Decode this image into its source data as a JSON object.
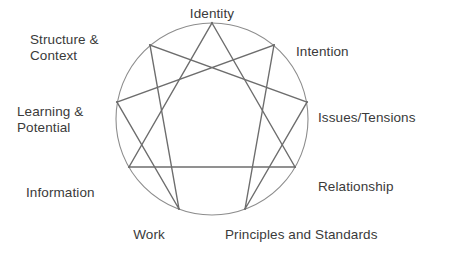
{
  "diagram": {
    "type": "enneagram",
    "stroke_color": "#6d6d6d",
    "circle_color": "#8d8d8d",
    "text_color": "#3a3a3a",
    "background_color": "#ffffff",
    "circle": {
      "cx": 212,
      "cy": 119,
      "r": 96
    },
    "nodes": [
      {
        "id": "identity",
        "label": "Identity",
        "point": 9,
        "angle_deg": -90,
        "x": 212,
        "y": 23
      },
      {
        "id": "intention",
        "label": "Intention",
        "point": 1,
        "angle_deg": -50,
        "x": 274,
        "y": 45
      },
      {
        "id": "issues-tensions",
        "label": "Issues/Tensions",
        "point": 2,
        "angle_deg": -10,
        "x": 307,
        "y": 102
      },
      {
        "id": "relationship",
        "label": "Relationship",
        "point": 3,
        "angle_deg": 30,
        "x": 295,
        "y": 167
      },
      {
        "id": "principles-standards",
        "label": "Principles and Standards",
        "point": 4,
        "angle_deg": 70,
        "x": 245,
        "y": 209
      },
      {
        "id": "work",
        "label": "Work",
        "point": 5,
        "angle_deg": 110,
        "x": 179,
        "y": 209
      },
      {
        "id": "information",
        "label": "Information",
        "point": 6,
        "angle_deg": 150,
        "x": 129,
        "y": 167
      },
      {
        "id": "learning-potential",
        "label": "Learning &\nPotential",
        "point": 7,
        "angle_deg": 190,
        "x": 117,
        "y": 102
      },
      {
        "id": "structure-context",
        "label": "Structure &\nContext",
        "point": 8,
        "angle_deg": 230,
        "x": 150,
        "y": 45
      }
    ],
    "triangle_path": [
      "identity",
      "relationship",
      "information"
    ],
    "hexad_path": [
      "intention",
      "principles-standards",
      "issues-tensions",
      "structure-context",
      "work",
      "learning-potential"
    ]
  }
}
